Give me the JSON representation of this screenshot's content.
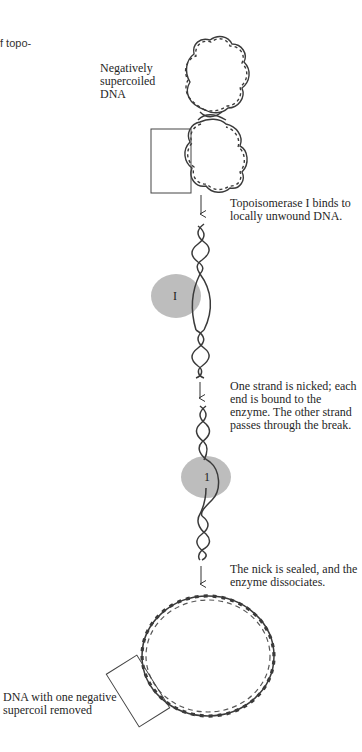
{
  "figure": {
    "cut_caption_fragment": "f topo-",
    "labels": {
      "start": "Negatively supercoiled DNA",
      "step1": "Topoisomerase I binds to locally unwound DNA.",
      "step2": "One strand is nicked; each end is bound to the enzyme. The other strand passes through the break.",
      "step3": "The nick is sealed, and the enzyme dissociates.",
      "end": "DNA with one negative supercoil removed"
    },
    "enzyme": {
      "letter_step1": "I",
      "letter_step2": "1",
      "fill_color": "#bdbdbd"
    },
    "colors": {
      "dna_strand": "#3a3a3a",
      "box_line": "#444444",
      "text": "#1f1f1f"
    }
  }
}
